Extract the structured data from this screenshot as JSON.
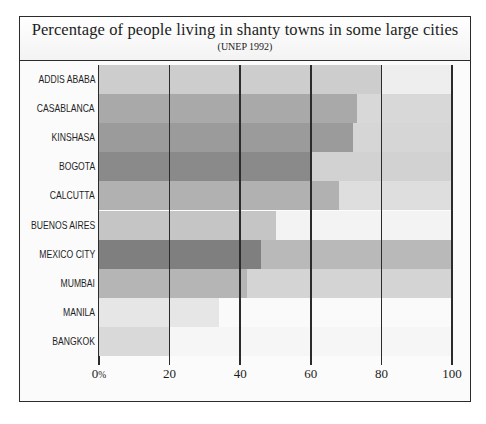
{
  "chart_data": {
    "type": "bar",
    "orientation": "horizontal",
    "title": "Percentage of people living in shanty towns in some large cities",
    "subtitle": "(UNEP 1992)",
    "source": "UNEP 1992",
    "xlabel": "",
    "ylabel": "",
    "xlim": [
      0,
      100
    ],
    "grid": true,
    "legend": false,
    "tick_labels": [
      "0%",
      "20",
      "40",
      "60",
      "80",
      "100"
    ],
    "tick_values": [
      0,
      20,
      40,
      60,
      80,
      100
    ],
    "first_tick_suffix": "%",
    "categories": [
      "ADDIS ABABA",
      "CASABLANCA",
      "KINSHASA",
      "BOGOTA",
      "CALCUTTA",
      "BUENOS AIRES",
      "MEXICO CITY",
      "MUMBAI",
      "MANILA",
      "BANGKOK"
    ],
    "values": [
      80,
      73,
      72,
      60,
      68,
      50,
      46,
      42,
      34,
      20
    ],
    "bar_colors": [
      "#cdcdcd",
      "#a9a9a9",
      "#9b9b9b",
      "#8a8a8a",
      "#b1b1b1",
      "#c5c5c5",
      "#7f7f7f",
      "#b5b5b5",
      "#e6e6e6",
      "#d9d9d9"
    ],
    "remainder_colors": [
      "#eeeeee",
      "#d8d8d8",
      "#d6d6d6",
      "#d2d2d2",
      "#dedede",
      "#f3f3f3",
      "#b9b9b9",
      "#d4d4d4",
      "#fafafa",
      "#f6f6f6"
    ]
  },
  "style": {
    "frame_color": "#2b2b2b",
    "grid_color": "#2b2b2b",
    "text_color": "#1c1c1c",
    "plot_background": "#fcfcfc"
  }
}
